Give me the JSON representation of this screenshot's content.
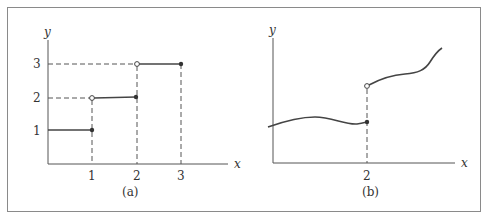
{
  "figure": {
    "panel_a": {
      "caption": "(a)",
      "x_axis_label": "x",
      "y_axis_label": "y",
      "x_ticks": [
        "1",
        "2",
        "3"
      ],
      "y_ticks": [
        "1",
        "2",
        "3"
      ],
      "description": "Step function: y=1 on (0,1], y=2 on (1,2], y=3 on (2,3]; open circles at left ends (1,2),(2,3); filled dots at (1,1),(2,2),(3,3)"
    },
    "panel_b": {
      "caption": "(b)",
      "x_axis_label": "x",
      "y_axis_label": "y",
      "x_ticks": [
        "2"
      ],
      "description": "Smooth curve with jump discontinuity at x=2; filled dot on lower branch, open circle on upper branch"
    }
  },
  "colors": {
    "line": "#444444",
    "frame": "#8a8a8a",
    "background": "#ffffff"
  }
}
